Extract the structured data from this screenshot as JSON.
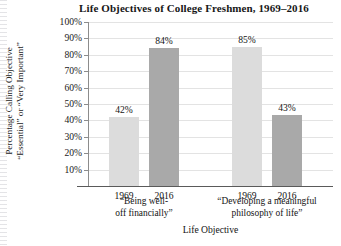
{
  "chart_data": {
    "type": "bar",
    "title": "Life Objectives of College Freshmen, 1969–2016",
    "xlabel": "Life Objective",
    "ylabel_line1": "Percentage Calling Objective",
    "ylabel_line2": "“Essential” or “Very Important”",
    "ylim": [
      0,
      100
    ],
    "ytick_labels": [
      "100%",
      "90%",
      "80%",
      "70%",
      "60%",
      "50%",
      "40%",
      "30%",
      "20%",
      "10%"
    ],
    "ytick_values": [
      100,
      90,
      80,
      70,
      60,
      50,
      40,
      30,
      20,
      10
    ],
    "grid": true,
    "legend": "none",
    "categories": [
      "Being well-off financially",
      "Developing a meaningful philosophy of life"
    ],
    "group_label_lines": [
      [
        "“Being well-",
        "off financially”"
      ],
      [
        "“Developing a meaningful",
        "philosophy of life”"
      ]
    ],
    "series": [
      {
        "name": "1969",
        "values": [
          42,
          85
        ],
        "color": "#dcdcdc"
      },
      {
        "name": "2016",
        "values": [
          84,
          43
        ],
        "color": "#a9a9a9"
      }
    ],
    "bars": [
      {
        "group": "Being well-off financially",
        "year": "1969",
        "value": 42,
        "label": "42%",
        "style": "light"
      },
      {
        "group": "Being well-off financially",
        "year": "2016",
        "value": 84,
        "label": "84%",
        "style": "dark"
      },
      {
        "group": "Developing a meaningful philosophy of life",
        "year": "1969",
        "value": 85,
        "label": "85%",
        "style": "light"
      },
      {
        "group": "Developing a meaningful philosophy of life",
        "year": "2016",
        "value": 43,
        "label": "43%",
        "style": "dark"
      }
    ],
    "xtick_labels": [
      "1969",
      "2016",
      "1969",
      "2016"
    ]
  }
}
